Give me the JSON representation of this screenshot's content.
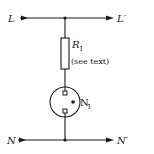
{
  "diagram": {
    "type": "circuit-schematic",
    "colors": {
      "ink": "#1a1a1a",
      "background": "#ffffff"
    },
    "live_line": {
      "input_label": "L",
      "output_label": "L′"
    },
    "neutral_line": {
      "input_label": "N",
      "output_label": "N′"
    },
    "resistor": {
      "label": "R",
      "subscript": "1",
      "note": "(see text)"
    },
    "lamp": {
      "label": "N",
      "subscript": "1",
      "kind": "neon-lamp"
    }
  }
}
